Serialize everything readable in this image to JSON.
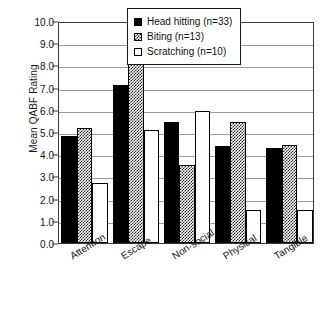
{
  "chart_data": {
    "type": "bar",
    "title": "",
    "xlabel": "",
    "ylabel": "Mean QABF Rating",
    "ylim": [
      0.0,
      10.0
    ],
    "ytick_step": 1.0,
    "grid": "horizontal",
    "legend_position": "top-right inside",
    "categories": [
      "Attention",
      "Escape",
      "Non-social",
      "Physical",
      "Tangible"
    ],
    "ytick_labels": [
      "10.0",
      "9.0",
      "8.0",
      "7.0",
      "6.0",
      "5.0",
      "4.0",
      "3.0",
      "2.0",
      "1.0",
      "0.0"
    ],
    "ytick_values": [
      10.0,
      9.0,
      8.0,
      7.0,
      6.0,
      5.0,
      4.0,
      3.0,
      2.0,
      1.0,
      0.0
    ],
    "series": [
      {
        "name": "Head hitting (n=33)",
        "fill": "solid-black",
        "values": [
          4.8,
          7.1,
          5.45,
          4.35,
          4.3
        ]
      },
      {
        "name": "Biting (n=13)",
        "fill": "hatched-gray",
        "values": [
          5.2,
          9.15,
          3.5,
          5.45,
          4.4
        ]
      },
      {
        "name": "Scratching (n=10)",
        "fill": "open-white",
        "values": [
          2.7,
          5.1,
          5.95,
          1.5,
          1.5
        ]
      }
    ]
  },
  "legend": {
    "items": [
      {
        "label": "Head hitting (n=33)",
        "fill": "solid"
      },
      {
        "label": "Biting (n=13)",
        "fill": "hatch"
      },
      {
        "label": "Scratching (n=10)",
        "fill": "open"
      }
    ]
  },
  "colors": {
    "series_head_hitting": "#000000",
    "series_biting": "#2b2b2b",
    "series_scratching": "#ffffff",
    "axis": "#3a3a3a",
    "gridline": "#9a9a9a",
    "text": "#111111",
    "background": "#ffffff"
  }
}
